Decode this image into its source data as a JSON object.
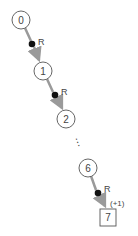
{
  "diagram": {
    "nodes": [
      {
        "id": "n0",
        "label": "0",
        "shape": "circle",
        "cx": 21,
        "cy": 20
      },
      {
        "id": "n1",
        "label": "1",
        "shape": "circle",
        "cx": 43,
        "cy": 71
      },
      {
        "id": "n2",
        "label": "2",
        "shape": "circle",
        "cx": 66,
        "cy": 119
      },
      {
        "id": "n6",
        "label": "6",
        "shape": "circle",
        "cx": 88,
        "cy": 168
      },
      {
        "id": "n7",
        "label": "7",
        "shape": "square",
        "cx": 108,
        "cy": 217
      }
    ],
    "edges": [
      {
        "from": "n0",
        "to": "n1",
        "label": "R",
        "dot": [
          32,
          44
        ]
      },
      {
        "from": "n1",
        "to": "n2",
        "label": "R",
        "dot": [
          55,
          95
        ]
      },
      {
        "from": "n6",
        "to": "n7",
        "label": "R",
        "dot": [
          98,
          193
        ],
        "annotation": "(+1)"
      }
    ],
    "ellipsis": "⋮",
    "colors": {
      "arrow": "#9a9a9a",
      "stroke": "#555555",
      "dot": "#111111"
    }
  }
}
